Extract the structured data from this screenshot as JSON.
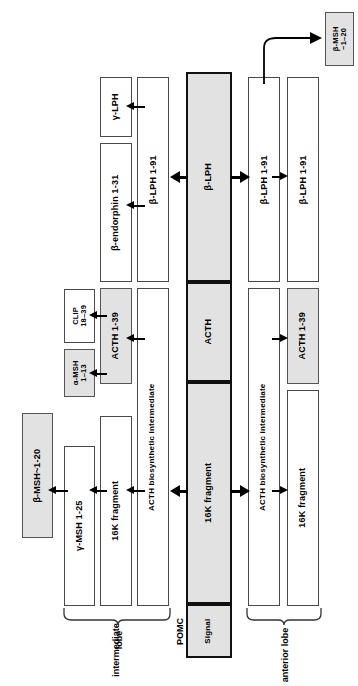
{
  "figure": {
    "type": "diagram",
    "orientation": "rotated-90"
  },
  "precursor": {
    "name": "POMC",
    "segments": [
      {
        "label": "Signal",
        "shaded": true
      },
      {
        "label": "16K fragment",
        "shaded": true
      },
      {
        "label": "ACTH",
        "shaded": true
      },
      {
        "label": "β-LPH",
        "shaded": true
      }
    ]
  },
  "lobes": {
    "intermediate": "intermediate\nlobe",
    "intermediate_line1": "intermediate",
    "intermediate_line2": "lobe",
    "anterior": "anterior lobe"
  },
  "intermediate_lobe": {
    "column_intermediate": [
      {
        "label": "β-LPH 1-91",
        "shaded": false
      },
      {
        "label": "ACTH biosynthetic intermediate",
        "shaded": false
      }
    ],
    "column_products": [
      {
        "label": "γ-LPH",
        "shaded": false
      },
      {
        "label": "β-endorphin 1-31",
        "shaded": false
      },
      {
        "label": "ACTH 1-39",
        "shaded": true
      },
      {
        "label": "16K fragment",
        "shaded": false
      }
    ],
    "column_peptides": [
      {
        "label": "CLIP\n18-39",
        "line1": "CLIP",
        "line2": "18–39",
        "shaded": false
      },
      {
        "label": "α-MSH\n1-13",
        "line1": "α-MSH",
        "line2": "1–13",
        "shaded": true
      },
      {
        "label": "γ-MSH 1-25",
        "shaded": false
      }
    ],
    "column_final": [
      {
        "label": "β-MSH~1-20",
        "shaded": true
      }
    ]
  },
  "anterior_lobe": {
    "column_intermediate": [
      {
        "label": "β-LPH 1-91",
        "shaded": false
      },
      {
        "label": "ACTH biosynthetic intermediate",
        "shaded": false
      }
    ],
    "column_products": [
      {
        "label": "β-LPH 1-91",
        "shaded": false
      },
      {
        "label": "ACTH 1-39",
        "shaded": true
      },
      {
        "label": "16K fragment",
        "shaded": false
      }
    ],
    "column_final": [
      {
        "label": "β-MSH\n~1-20",
        "line1": "β-MSH",
        "line2": "~1–20",
        "shaded": true
      }
    ]
  },
  "colors": {
    "segment_fill": "#e2e2e2",
    "box_fill": "#ffffff",
    "stroke": "#4a4a4a",
    "precursor_stroke": "#111111"
  }
}
